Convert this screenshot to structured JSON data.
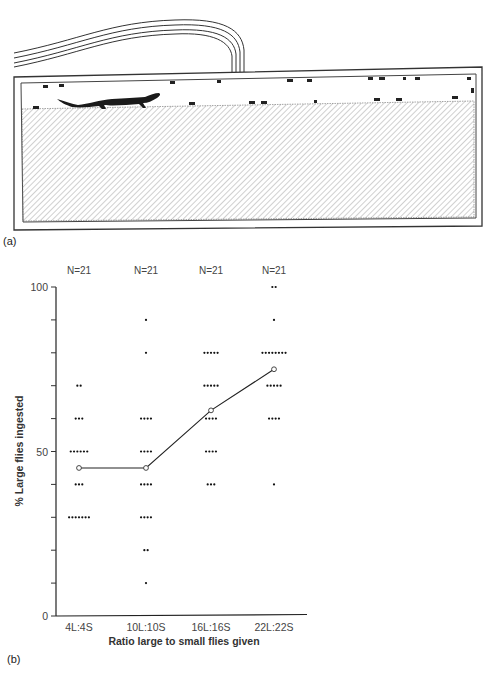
{
  "panel_a": {
    "label": "(a)",
    "illustration": "terrarium-with-salamander-and-flies",
    "icons": [
      "salamander-icon",
      "fly-icon",
      "air-tube-icon",
      "soil-hatch"
    ]
  },
  "panel_b": {
    "label": "(b)"
  },
  "chart_data": {
    "type": "scatter",
    "title": "",
    "xlabel": "Ratio large to small flies given",
    "ylabel": "% Large flies ingested",
    "categories": [
      "4L:4S",
      "10L:10S",
      "16L:16S",
      "22L:22S"
    ],
    "sample_sizes": [
      "N=21",
      "N=21",
      "N=21",
      "N=21"
    ],
    "ylim": [
      0,
      100
    ],
    "yticks": [
      0,
      10,
      20,
      30,
      40,
      50,
      60,
      70,
      80,
      90,
      100
    ],
    "ytick_labels": {
      "0": "0",
      "50": "50",
      "100": "100"
    },
    "grid": false,
    "series": [
      {
        "name": "individual observations (count of dots per value)",
        "points": [
          [
            {
              "y": 70,
              "count": 2
            },
            {
              "y": 60,
              "count": 3
            },
            {
              "y": 50,
              "count": 6
            },
            {
              "y": 40,
              "count": 3
            },
            {
              "y": 30,
              "count": 7
            }
          ],
          [
            {
              "y": 90,
              "count": 1
            },
            {
              "y": 80,
              "count": 1
            },
            {
              "y": 60,
              "count": 4
            },
            {
              "y": 50,
              "count": 4
            },
            {
              "y": 40,
              "count": 4
            },
            {
              "y": 30,
              "count": 4
            },
            {
              "y": 20,
              "count": 2
            },
            {
              "y": 10,
              "count": 1
            }
          ],
          [
            {
              "y": 80,
              "count": 5
            },
            {
              "y": 70,
              "count": 5
            },
            {
              "y": 60,
              "count": 4
            },
            {
              "y": 50,
              "count": 4
            },
            {
              "y": 40,
              "count": 3
            }
          ],
          [
            {
              "y": 100,
              "count": 2
            },
            {
              "y": 90,
              "count": 1
            },
            {
              "y": 80,
              "count": 8
            },
            {
              "y": 70,
              "count": 5
            },
            {
              "y": 60,
              "count": 4
            },
            {
              "y": 40,
              "count": 1
            }
          ]
        ]
      },
      {
        "name": "mean",
        "type": "line",
        "values": [
          45,
          45,
          62.5,
          75
        ]
      }
    ]
  }
}
